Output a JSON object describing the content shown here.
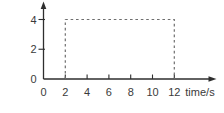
{
  "figure": {
    "background": "#ffffff",
    "axis_color": "#2e2e2e",
    "dash_color": "#6e6e6e",
    "label_color": "#3a3a3a"
  },
  "chart_data": {
    "type": "line",
    "title": "",
    "xlabel": "time/s",
    "ylabel": "",
    "x_ticks": [
      0,
      2,
      4,
      6,
      8,
      10,
      12
    ],
    "y_ticks": [
      0,
      2,
      4
    ],
    "xlim": [
      0,
      15.8
    ],
    "ylim": [
      0,
      5.2
    ],
    "grid": false,
    "legend": "none",
    "series": [
      {
        "name": "pulse-outline",
        "style": "dashed",
        "points": [
          [
            2,
            0
          ],
          [
            2,
            4
          ],
          [
            12,
            4
          ],
          [
            12,
            0
          ]
        ]
      }
    ]
  }
}
